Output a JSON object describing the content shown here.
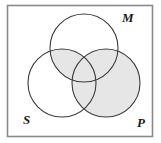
{
  "figure": {
    "kind": "syllogism-venn-diagram",
    "frame": {
      "x": 7,
      "y": 5,
      "width": 146,
      "height": 132,
      "stroke_color": "#8a8a8a",
      "fill_color": "#ffffff"
    },
    "background_color": "#ffffff",
    "circle_stroke_color": "#3c3c3c",
    "shading_color": "#e6e6e6",
    "circles": [
      {
        "id": "M",
        "label": "M",
        "cx": 84,
        "cy": 48,
        "r": 34
      },
      {
        "id": "S",
        "label": "S",
        "cx": 62,
        "cy": 83,
        "r": 34
      },
      {
        "id": "P",
        "label": "P",
        "cx": 106,
        "cy": 83,
        "r": 34
      }
    ],
    "labels": [
      {
        "id": "label-m",
        "text": "M",
        "x": 122,
        "y": 22,
        "belongs_to": "M"
      },
      {
        "id": "label-s",
        "text": "S",
        "x": 23,
        "y": 124,
        "belongs_to": "S"
      },
      {
        "id": "label-p",
        "text": "P",
        "x": 137,
        "y": 127,
        "belongs_to": "P"
      }
    ],
    "shaded_regions": [
      {
        "id": "region-p",
        "description": "P circle interior",
        "shaded": true
      },
      {
        "id": "region-m-and-s",
        "description": "M intersect S",
        "shaded": true
      },
      {
        "id": "region-m-only",
        "description": "M only",
        "shaded": false
      },
      {
        "id": "region-s-only",
        "description": "S only",
        "shaded": false
      }
    ]
  }
}
